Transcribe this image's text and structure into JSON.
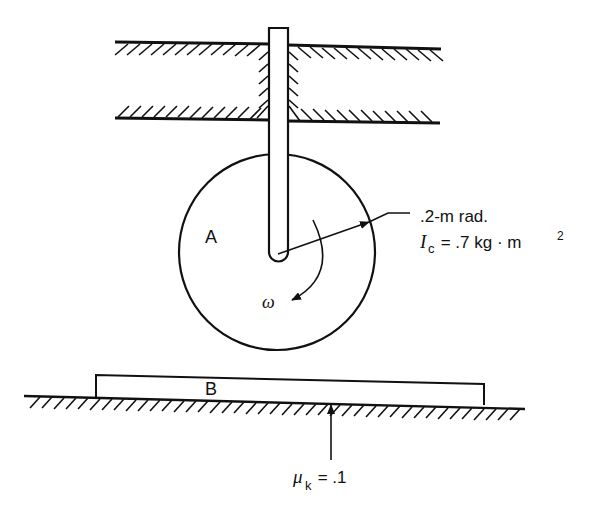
{
  "figure": {
    "type": "mechanics-diagram"
  },
  "labels": {
    "disk": "A",
    "plank": "B",
    "omega": "ω",
    "radius": ".2-m rad.",
    "inertia_symbol": "I",
    "inertia_subscript": "c",
    "inertia_value": " = .7 kg · m",
    "inertia_exponent": "2",
    "mu_symbol": "μ",
    "mu_subscript": "k",
    "mu_value": " = .1"
  },
  "geometry": {
    "disk_center": [
      277,
      252
    ],
    "disk_radius": 98,
    "rod_x": [
      269,
      288
    ],
    "rod_top": 28,
    "guide_top_y": [
      42,
      49
    ],
    "guide_bottom_y": [
      118,
      123
    ],
    "plank_x": [
      96,
      484
    ],
    "ground_y": [
      397,
      410
    ]
  },
  "colors": {
    "stroke": "#111111",
    "background": "#ffffff"
  }
}
